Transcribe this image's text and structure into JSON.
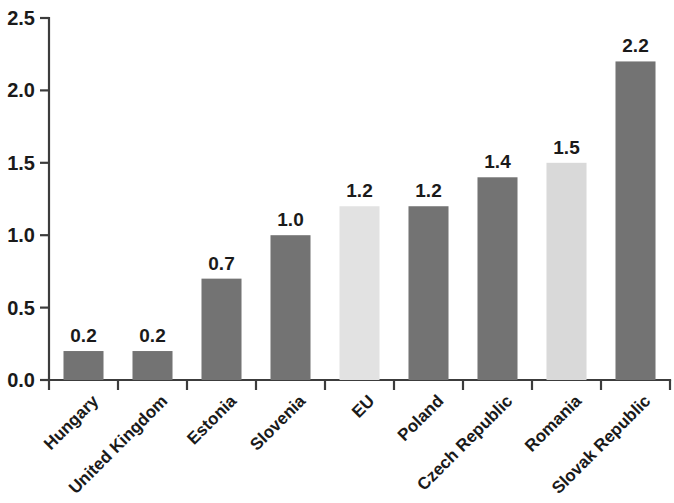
{
  "chart_data": {
    "type": "bar",
    "title": "",
    "subtitle": "",
    "xlabel": "",
    "ylabel": "",
    "categories": [
      "Hungary",
      "United Kingdom",
      "Estonia",
      "Slovenia",
      "EU",
      "Poland",
      "Czech Republic",
      "Romania",
      "Slovak Republic"
    ],
    "values": [
      0.2,
      0.2,
      0.7,
      1.0,
      1.2,
      1.2,
      1.4,
      1.5,
      2.2
    ],
    "data_labels": [
      "0.2",
      "0.2",
      "0.7",
      "1.0",
      "1.2",
      "1.2",
      "1.4",
      "1.5",
      "2.2"
    ],
    "bar_colors": [
      "#737373",
      "#737373",
      "#737373",
      "#737373",
      "#e2e2e2",
      "#737373",
      "#737373",
      "#d9d9d9",
      "#737373"
    ],
    "highlighted_categories": [
      "EU",
      "Romania"
    ],
    "ylim": [
      0.0,
      2.5
    ],
    "ytick_values": [
      0.0,
      0.5,
      1.0,
      1.5,
      2.0,
      2.5
    ],
    "ytick_labels": [
      "0.0",
      "0.5",
      "1.0",
      "1.5",
      "2.0",
      "2.5"
    ],
    "grid": false,
    "legend": "none",
    "xtick_label_rotation": -45,
    "colors": {
      "bar_dark": "#737373",
      "bar_light": "#e2e2e2",
      "axis": "#3c3c3c",
      "text": "#1a1a1a",
      "background": "#ffffff"
    }
  }
}
